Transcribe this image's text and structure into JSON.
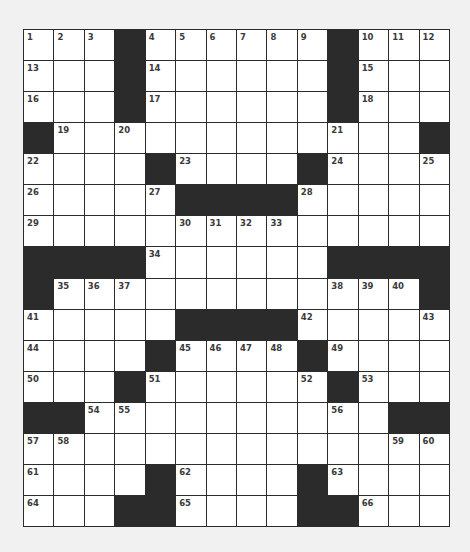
{
  "puzzle": {
    "cols": 14,
    "rows": 16,
    "colors": {
      "block": "#2b2b2b",
      "cell": "#ffffff",
      "background": "#f1f1f1",
      "number": "#3a3a3a"
    },
    "layout": [
      [
        "1",
        "2",
        "3",
        "#",
        "4",
        "5",
        "6",
        "7",
        "8",
        "9",
        "#",
        "10",
        "11",
        "12"
      ],
      [
        "13",
        ".",
        ".",
        "#",
        "14",
        ".",
        ".",
        ".",
        ".",
        ".",
        "#",
        "15",
        ".",
        "."
      ],
      [
        "16",
        ".",
        ".",
        "#",
        "17",
        ".",
        ".",
        ".",
        ".",
        ".",
        "#",
        "18",
        ".",
        "."
      ],
      [
        "#",
        "19",
        ".",
        "20",
        ".",
        ".",
        ".",
        ".",
        ".",
        ".",
        "21",
        ".",
        ".",
        "#"
      ],
      [
        "22",
        ".",
        ".",
        ".",
        "#",
        "23",
        ".",
        ".",
        ".",
        "#",
        "24",
        ".",
        ".",
        "25"
      ],
      [
        "26",
        ".",
        ".",
        ".",
        "27",
        "#",
        "#",
        "#",
        "#",
        "28",
        ".",
        ".",
        ".",
        "."
      ],
      [
        "29",
        ".",
        ".",
        ".",
        ".",
        "30",
        "31",
        "32",
        "33",
        ".",
        ".",
        ".",
        ".",
        "."
      ],
      [
        "#",
        "#",
        "#",
        "#",
        "34",
        ".",
        ".",
        ".",
        ".",
        ".",
        "#",
        "#",
        "#",
        "#"
      ],
      [
        "#",
        "35",
        "36",
        "37",
        ".",
        ".",
        ".",
        ".",
        ".",
        ".",
        "38",
        "39",
        "40",
        "#"
      ],
      [
        "41",
        ".",
        ".",
        ".",
        ".",
        "#",
        "#",
        "#",
        "#",
        "42",
        ".",
        ".",
        ".",
        "43"
      ],
      [
        "44",
        ".",
        ".",
        ".",
        "#",
        "45",
        "46",
        "47",
        "48",
        "#",
        "49",
        ".",
        ".",
        "."
      ],
      [
        "50",
        ".",
        ".",
        "#",
        "51",
        ".",
        ".",
        ".",
        ".",
        "52",
        "#",
        "53",
        ".",
        "."
      ],
      [
        "#",
        "#",
        "54",
        "55",
        ".",
        ".",
        ".",
        ".",
        ".",
        ".",
        "56",
        ".",
        "#",
        "#"
      ],
      [
        "57",
        "58",
        ".",
        ".",
        ".",
        ".",
        ".",
        ".",
        ".",
        ".",
        ".",
        ".",
        "59",
        "60"
      ],
      [
        "61",
        ".",
        ".",
        ".",
        "#",
        "62",
        ".",
        ".",
        ".",
        "#",
        "63",
        ".",
        ".",
        "."
      ],
      [
        "64",
        ".",
        ".",
        "#",
        "#",
        "65",
        ".",
        ".",
        ".",
        "#",
        "#",
        "66",
        ".",
        "."
      ]
    ],
    "entries": []
  }
}
